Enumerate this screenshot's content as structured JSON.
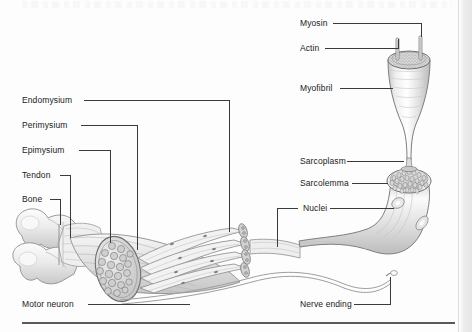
{
  "figure": {
    "type": "anatomical-diagram",
    "medium": "grayscale pencil illustration (scanned textbook page)"
  },
  "labels": {
    "endomysium": "Endomysium",
    "perimysium": "Perimysium",
    "epimysium": "Epimysium",
    "tendon": "Tendon",
    "bone": "Bone",
    "motor_neuron": "Motor neuron",
    "myosin": "Myosin",
    "actin": "Actin",
    "myofibril": "Myofibril",
    "sarcoplasm": "Sarcoplasm",
    "sarcolemma": "Sarcolemma",
    "nuclei": "Nuclei",
    "nerve_ending": "Nerve ending"
  },
  "colors": {
    "ink": "#1b1b1b",
    "leader": "#3a3a3a",
    "rule": "#5a5a5a",
    "art_outline": "#8a8a8a",
    "art_fill_light": "#f2f2f2",
    "art_fill_mid": "#dcdcdc",
    "art_fill_dark": "#b8b8b8",
    "page": "#fdfdfd",
    "scan_edge": "#e6e6e6"
  },
  "parts": {
    "bone": "Two condylar lobes at the far left of the limb",
    "tendon": "Banded connective sheet joining bone to the muscle belly",
    "muscle_belly": "Tapering muscle with an elliptical cut face of packed fascicles",
    "fascicles": "Bundle of long fibers splaying toward the right",
    "muscle_fiber": "Large curved tube with a honeycomb cut face",
    "myofibril": "Funnel-shaped enlargement with a speckled top face",
    "filaments": "Two thin rods rising from the myofibril top face",
    "nerve": "Thin motor neuron axon running beneath the fibers to the nerve ending"
  }
}
